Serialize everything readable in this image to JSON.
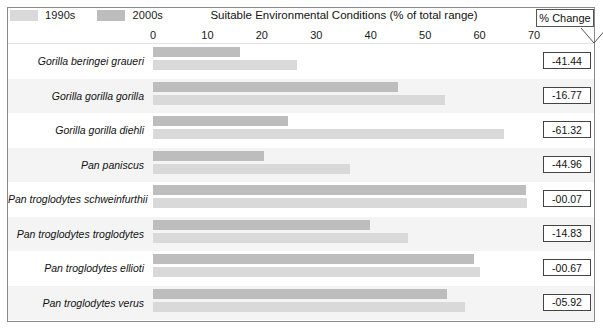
{
  "legend": {
    "items": [
      {
        "label": "1990s",
        "color": "#d9d9d9"
      },
      {
        "label": "2000s",
        "color": "#bdbdbd"
      }
    ]
  },
  "header": {
    "pct_change_label": "% Change"
  },
  "chart_data": {
    "type": "bar",
    "orientation": "horizontal",
    "title": "Suitable Environmental Conditions (% of total range)",
    "xlabel": "",
    "ylabel": "",
    "xlim": [
      0,
      70
    ],
    "xticks": [
      0,
      10,
      20,
      30,
      40,
      50,
      60,
      70
    ],
    "grid": false,
    "legend_position": "top-left",
    "categories": [
      "Gorilla beringei graueri",
      "Gorilla gorilla gorilla",
      "Gorilla gorilla diehli",
      "Pan paniscus",
      "Pan troglodytes schweinfurthii",
      "Pan troglodytes troglodytes",
      "Pan troglodytes ellioti",
      "Pan troglodytes verus"
    ],
    "series": [
      {
        "name": "2000s",
        "color": "#bdbdbd",
        "values": [
          16.0,
          45.0,
          24.8,
          20.4,
          68.6,
          39.9,
          59.0,
          54.0
        ]
      },
      {
        "name": "1990s",
        "color": "#d9d9d9",
        "values": [
          26.5,
          53.7,
          64.5,
          36.2,
          68.7,
          46.9,
          60.1,
          57.3
        ]
      }
    ],
    "annotations": {
      "label": "% Change",
      "values": [
        "-41.44",
        "-16.77",
        "-61.32",
        "-44.96",
        "-00.07",
        "-14.83",
        "-00.67",
        "-05.92"
      ]
    }
  },
  "axis": {
    "ticks": [
      "0",
      "10",
      "20",
      "30",
      "40",
      "50",
      "60",
      "70"
    ]
  }
}
